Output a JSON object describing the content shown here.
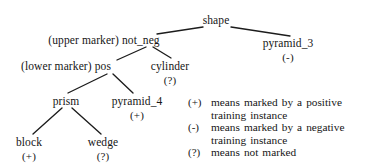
{
  "diagram": {
    "type": "concept-version-space-tree",
    "nodes": [
      {
        "id": "shape",
        "label": "shape",
        "mark": "",
        "x": 216,
        "y": 14
      },
      {
        "id": "not_neg",
        "label": "(upper marker) not_neg",
        "mark": "",
        "x": 104,
        "y": 34
      },
      {
        "id": "pyramid_3",
        "label": "pyramid_3",
        "mark": "(-)",
        "x": 288,
        "y": 37
      },
      {
        "id": "pos",
        "label": "(lower marker) pos",
        "mark": "",
        "x": 66,
        "y": 60
      },
      {
        "id": "cylinder",
        "label": "cylinder",
        "mark": "(?)",
        "x": 170,
        "y": 60
      },
      {
        "id": "prism",
        "label": "prism",
        "mark": "",
        "x": 66,
        "y": 95
      },
      {
        "id": "pyramid_4",
        "label": "pyramid_4",
        "mark": "(+)",
        "x": 137,
        "y": 95
      },
      {
        "id": "block",
        "label": "block",
        "mark": "(+)",
        "x": 29,
        "y": 136
      },
      {
        "id": "wedge",
        "label": "wedge",
        "mark": "(?)",
        "x": 103,
        "y": 136
      }
    ],
    "edges": [
      {
        "from": "shape",
        "to": "not_neg",
        "x1": 203,
        "y1": 27,
        "x2": 157,
        "y2": 34
      },
      {
        "from": "shape",
        "to": "pyramid_3",
        "x1": 231,
        "y1": 27,
        "x2": 290,
        "y2": 36
      },
      {
        "from": "not_neg",
        "to": "pos",
        "x1": 146,
        "y1": 47,
        "x2": 117,
        "y2": 60
      },
      {
        "from": "not_neg",
        "to": "cylinder",
        "x1": 153,
        "y1": 47,
        "x2": 171,
        "y2": 58
      },
      {
        "from": "pos",
        "to": "prism",
        "x1": 107,
        "y1": 74,
        "x2": 68,
        "y2": 93
      },
      {
        "from": "pos",
        "to": "pyramid_4",
        "x1": 113,
        "y1": 74,
        "x2": 133,
        "y2": 93
      },
      {
        "from": "prism",
        "to": "block",
        "x1": 62,
        "y1": 108,
        "x2": 33,
        "y2": 134
      },
      {
        "from": "prism",
        "to": "wedge",
        "x1": 72,
        "y1": 108,
        "x2": 101,
        "y2": 134
      }
    ],
    "line_color": "#1c1c1c"
  },
  "legend": {
    "rows": [
      {
        "symbol": "(+)",
        "text_line1": "means marked by a positive",
        "text_line2": "training instance"
      },
      {
        "symbol": "(-)",
        "text_line1": "means marked by a negative",
        "text_line2": "training instance"
      },
      {
        "symbol": "(?)",
        "text_line1": "means not marked",
        "text_line2": ""
      }
    ]
  }
}
